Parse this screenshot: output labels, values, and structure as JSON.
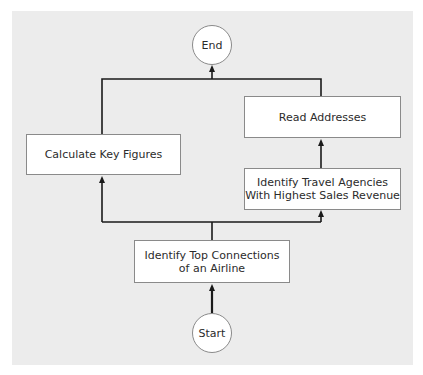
{
  "diagram": {
    "type": "flowchart",
    "nodes": {
      "end": {
        "label": "End",
        "shape": "circle"
      },
      "start": {
        "label": "Start",
        "shape": "circle"
      },
      "read_addresses": {
        "label": "Read Addresses",
        "shape": "rectangle"
      },
      "calculate_key_figures": {
        "label": "Calculate Key Figures",
        "shape": "rectangle"
      },
      "identify_travel_agencies": {
        "line1": "Identify Travel Agencies",
        "line2": "With Highest Sales Revenue",
        "shape": "rectangle"
      },
      "identify_top_connections": {
        "line1": "Identify Top Connections",
        "line2": "of an Airline",
        "shape": "rectangle"
      }
    },
    "edges": [
      {
        "from": "Start",
        "to": "Identify Top Connections of an Airline"
      },
      {
        "from": "Identify Top Connections of an Airline",
        "to": "Calculate Key Figures"
      },
      {
        "from": "Identify Top Connections of an Airline",
        "to": "Identify Travel Agencies With Highest Sales Revenue"
      },
      {
        "from": "Identify Travel Agencies With Highest Sales Revenue",
        "to": "Read Addresses"
      },
      {
        "from": "Calculate Key Figures",
        "to": "End"
      },
      {
        "from": "Read Addresses",
        "to": "End"
      }
    ],
    "colors": {
      "background": "#ececec",
      "node_fill": "#ffffff",
      "node_border": "#8a8a8a",
      "connector": "#1a1a1a",
      "text": "#2b2b2b"
    }
  }
}
